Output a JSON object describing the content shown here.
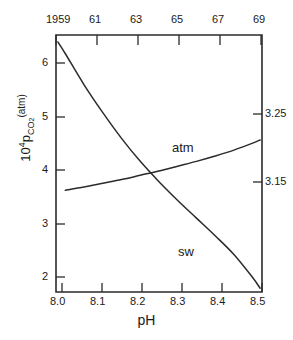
{
  "chart_data": {
    "type": "line",
    "title": "",
    "xlabel": "pH",
    "ylabel": "10^4 p_CO2 (atm)",
    "ylabel_parts": {
      "mantissa": "10",
      "exponent": "4",
      "p": "p",
      "sub": "CO",
      "sub2": "2",
      "units": "(atm)"
    },
    "xlim": [
      7.975,
      8.525
    ],
    "ylim": [
      1.55,
      6.35
    ],
    "grid": false,
    "legend_position": "inline-annotations",
    "axes": {
      "bottom": {
        "name": "pH",
        "ticks": [
          8.0,
          8.1,
          8.2,
          8.3,
          8.4,
          8.5
        ],
        "ticklabels": [
          "8.0",
          "8.1",
          "8.2",
          "8.3",
          "8.4",
          "8.5"
        ]
      },
      "left": {
        "name": "10^4 pCO2 (atm)",
        "ticks": [
          2,
          3,
          4,
          5,
          6
        ],
        "ticklabels": [
          "2",
          "3",
          "4",
          "5",
          "6"
        ]
      },
      "top": {
        "name": "year",
        "ticks": [
          1959,
          1961,
          1963,
          1965,
          1967,
          1969
        ],
        "ticklabels": [
          "1959",
          "61",
          "63",
          "65",
          "67",
          "69"
        ]
      },
      "right": {
        "name": "log pCO2",
        "ticks": [
          3.15,
          3.25
        ],
        "ticklabels": [
          "3.25",
          "3.15"
        ]
      }
    },
    "series": [
      {
        "name": "atm",
        "label": "atm",
        "annotation": "atm",
        "x": [
          8.0,
          8.05,
          8.1,
          8.15,
          8.2,
          8.25,
          8.3,
          8.35,
          8.4,
          8.45,
          8.5,
          8.52
        ],
        "y": [
          3.45,
          3.51,
          3.58,
          3.65,
          3.73,
          3.81,
          3.9,
          3.99,
          4.09,
          4.2,
          4.33,
          4.39
        ]
      },
      {
        "name": "sw",
        "label": "sw",
        "annotation": "sw",
        "x": [
          7.98,
          8.0,
          8.05,
          8.1,
          8.15,
          8.2,
          8.25,
          8.3,
          8.35,
          8.4,
          8.45,
          8.5,
          8.52
        ],
        "y": [
          6.22,
          6.0,
          5.42,
          4.9,
          4.42,
          3.99,
          3.61,
          3.26,
          2.93,
          2.6,
          2.25,
          1.82,
          1.62
        ]
      }
    ],
    "annotations": [
      {
        "text": "atm",
        "x": 8.27,
        "y": 4.18
      },
      {
        "text": "sw",
        "x": 8.29,
        "y": 2.18
      }
    ],
    "colors": {
      "line": "#2b2b2b",
      "axis": "#2b2b2b",
      "background": "#ffffff"
    }
  }
}
